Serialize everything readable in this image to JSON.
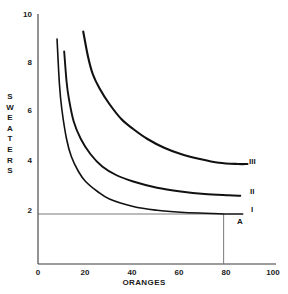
{
  "chart_data": {
    "type": "line",
    "title": "",
    "xlabel": "ORANGES",
    "ylabel": "SWEATERS",
    "xlim": [
      0,
      100
    ],
    "ylim": [
      0,
      10
    ],
    "xticks": [
      "0",
      "20",
      "40",
      "60",
      "80",
      "100"
    ],
    "yticks": [
      "2",
      "4",
      "6",
      "8",
      "10"
    ],
    "grid": false,
    "legend_position": "right-of-curve-ends",
    "series": [
      {
        "name": "I",
        "label": "I",
        "points": [
          [
            8,
            9.0
          ],
          [
            9,
            7.2
          ],
          [
            10,
            6.2
          ],
          [
            12,
            5.0
          ],
          [
            14,
            4.3
          ],
          [
            17,
            3.7
          ],
          [
            20,
            3.3
          ],
          [
            25,
            2.9
          ],
          [
            30,
            2.6
          ],
          [
            40,
            2.3
          ],
          [
            50,
            2.15
          ],
          [
            60,
            2.07
          ],
          [
            70,
            2.03
          ],
          [
            80,
            2.0
          ],
          [
            86,
            2.0
          ]
        ]
      },
      {
        "name": "II",
        "label": "II",
        "points": [
          [
            11,
            8.5
          ],
          [
            12,
            7.3
          ],
          [
            13,
            6.6
          ],
          [
            15,
            5.7
          ],
          [
            18,
            5.0
          ],
          [
            22,
            4.4
          ],
          [
            27,
            3.9
          ],
          [
            33,
            3.55
          ],
          [
            40,
            3.3
          ],
          [
            50,
            3.05
          ],
          [
            60,
            2.9
          ],
          [
            70,
            2.8
          ],
          [
            80,
            2.75
          ],
          [
            85,
            2.73
          ]
        ]
      },
      {
        "name": "III",
        "label": "III",
        "points": [
          [
            19,
            9.3
          ],
          [
            21,
            8.3
          ],
          [
            23,
            7.6
          ],
          [
            26,
            7.0
          ],
          [
            30,
            6.4
          ],
          [
            35,
            5.8
          ],
          [
            40,
            5.4
          ],
          [
            46,
            5.0
          ],
          [
            53,
            4.65
          ],
          [
            60,
            4.4
          ],
          [
            68,
            4.2
          ],
          [
            76,
            4.05
          ],
          [
            84,
            4.0
          ],
          [
            88,
            4.0
          ]
        ]
      }
    ],
    "annotations": [
      {
        "name": "point-A",
        "label": "A",
        "x": 80,
        "y": 1.75
      }
    ],
    "reference_lines": [
      {
        "name": "horizontal-reference-line",
        "orientation": "horizontal",
        "y": 2,
        "x_from": 0,
        "x_to": 78
      },
      {
        "name": "vertical-reference-line",
        "orientation": "vertical",
        "x": 78,
        "y_from": 0,
        "y_to": 2
      }
    ],
    "colors": {
      "curve": "#111111",
      "axis": "#3a3a3a",
      "reference_line": "#6a6a6a",
      "background": "#ffffff"
    }
  },
  "axis": {
    "y_title_letters": [
      "S",
      "W",
      "E",
      "A",
      "T",
      "E",
      "R",
      "S"
    ],
    "x_title": "ORANGES"
  }
}
